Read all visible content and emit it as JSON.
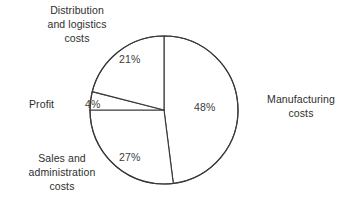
{
  "chart_data": {
    "type": "pie",
    "title": "",
    "subtitle": "",
    "xlabel": "",
    "ylabel": "",
    "grid": false,
    "legend_position": "none",
    "units": "percent",
    "start_angle_deg": 0,
    "direction": "clockwise",
    "categories": [
      "Manufacturing costs",
      "Sales and administration costs",
      "Profit",
      "Distribution and logistics costs"
    ],
    "values": [
      48,
      27,
      4,
      21
    ],
    "value_labels": [
      "48%",
      "27%",
      "4%",
      "21%"
    ],
    "total": 100,
    "slices": [
      {
        "label": "Manufacturing costs",
        "value": 48,
        "value_label": "48%",
        "fill": "#ffffff",
        "stroke": "#3a3a3a"
      },
      {
        "label": "Sales and administration costs",
        "value": 27,
        "value_label": "27%",
        "fill": "#ffffff",
        "stroke": "#3a3a3a"
      },
      {
        "label": "Profit",
        "value": 4,
        "value_label": "4%",
        "fill": "#ffffff",
        "stroke": "#3a3a3a"
      },
      {
        "label": "Distribution and logistics costs",
        "value": 21,
        "value_label": "21%",
        "fill": "#ffffff",
        "stroke": "#3a3a3a"
      }
    ]
  },
  "labels": {
    "distribution": "Distribution\nand logistics\ncosts",
    "manufacturing": "Manufacturing\ncosts",
    "sales": "Sales and\nadministration\ncosts",
    "profit": "Profit"
  },
  "values": {
    "manufacturing": "48%",
    "sales": "27%",
    "profit": "4%",
    "distribution": "21%"
  },
  "colors": {
    "background": "#ffffff",
    "slice_fill": "#ffffff",
    "outline": "#3a3a3a",
    "text": "#2e2e2e",
    "value_text": "#3c3c3c"
  }
}
